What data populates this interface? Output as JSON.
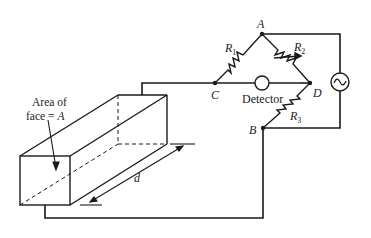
{
  "diagram": {
    "nodes": {
      "A": {
        "label": "A"
      },
      "B": {
        "label": "B"
      },
      "C": {
        "label": "C"
      },
      "D": {
        "label": "D"
      }
    },
    "resistors": [
      {
        "id": "R1",
        "label": "R",
        "sub": "1",
        "between": [
          "C",
          "A"
        ]
      },
      {
        "id": "R2",
        "label": "R",
        "sub": "2",
        "between": [
          "A",
          "D"
        ],
        "variable": true
      },
      {
        "id": "R3",
        "label": "R",
        "sub": "3",
        "between": [
          "D",
          "B"
        ]
      }
    ],
    "detector": {
      "label": "Detector",
      "between": [
        "C",
        "D"
      ]
    },
    "source": {
      "symbol": "~",
      "type": "AC source"
    },
    "cell": {
      "area_label_line1": "Area of",
      "area_label_line2_prefix": "face = ",
      "area_label_line2_var": "A",
      "length_label": "d"
    },
    "colors": {
      "line": "#1a1a1a",
      "text": "#222222",
      "background": "#ffffff"
    }
  }
}
